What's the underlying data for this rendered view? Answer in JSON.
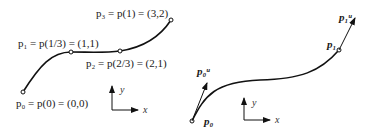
{
  "left_figure": {
    "labels": {
      "p0": "p₀ = p(0) = (0,0)",
      "p1": "p₁ = p(1/3) = (1,1)",
      "p2": "p₂ = p(2/3) = (2,1)",
      "p3": "p₃ = p(1) = (3,2)"
    },
    "axes": {
      "x": "x",
      "y": "y"
    }
  },
  "right_figure": {
    "labels": {
      "p0": "p₀",
      "p1": "p₁",
      "p0u": "p₀ᵘ",
      "p1u": "p₁ᵘ"
    },
    "axes": {
      "x": "x",
      "y": "y"
    }
  },
  "colors": {
    "curve": "#111111",
    "text": "#1a1a1a"
  }
}
